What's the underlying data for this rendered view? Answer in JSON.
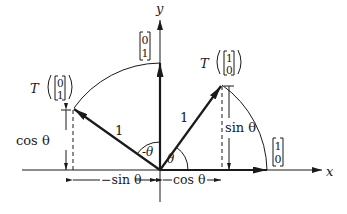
{
  "diagram": {
    "axes": {
      "x_label": "x",
      "y_label": "y"
    },
    "vectors": {
      "e1": {
        "label_top": "1",
        "label_bottom": "0"
      },
      "e2": {
        "label_top": "0",
        "label_bottom": "1"
      },
      "T_e1": {
        "prefix": "T",
        "label_top": "1",
        "label_bottom": "0",
        "length_label": "1"
      },
      "T_e2": {
        "prefix": "T",
        "label_top": "0",
        "label_bottom": "1",
        "length_label": "1"
      }
    },
    "angles": {
      "theta": "θ",
      "neg_theta": "-θ"
    },
    "dimensions": {
      "cos_vertical": "cos θ",
      "sin_vertical": "sin θ",
      "neg_sin_horizontal": "−sin θ",
      "cos_horizontal": "cos θ"
    },
    "colors": {
      "ink": "#1a1a1a",
      "background": "#ffffff"
    }
  }
}
